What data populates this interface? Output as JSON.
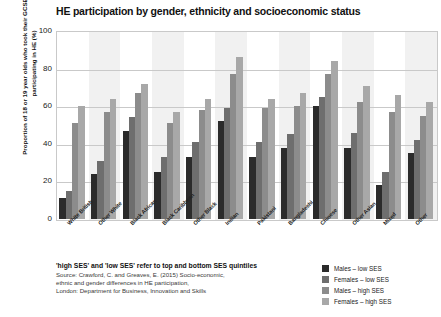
{
  "chart_data": {
    "type": "bar",
    "title": "HE participation by gender, ethnicity and socioeconomic status",
    "xlabel": "",
    "ylabel": "Proportion of 18 or 19 year olds who took their GCSEs in 2008 participating in HE (%)",
    "ylim": [
      0,
      100
    ],
    "yticks": [
      0,
      20,
      40,
      60,
      80,
      100
    ],
    "grid": true,
    "legend_position": "bottom-right",
    "categories": [
      "White British",
      "Other White",
      "Black African",
      "Black Caribbean",
      "Other Black",
      "Indian",
      "Pakistani",
      "Bangladeshi",
      "Chinese",
      "Other Asian",
      "Mixed",
      "Other"
    ],
    "series": [
      {
        "name": "Males – low SES",
        "color": "#2b2b2b",
        "values": [
          11,
          24,
          47,
          25,
          33,
          52,
          33,
          38,
          60,
          38,
          18,
          35
        ]
      },
      {
        "name": "Females – low SES",
        "color": "#6e6e6e",
        "values": [
          15,
          31,
          54,
          33,
          41,
          59,
          41,
          45,
          65,
          46,
          25,
          42
        ]
      },
      {
        "name": "Males – high SES",
        "color": "#8c8c8c",
        "values": [
          51,
          57,
          67,
          51,
          58,
          77,
          59,
          60,
          77,
          62,
          57,
          55
        ]
      },
      {
        "name": "Females – high SES",
        "color": "#a8a8a8",
        "values": [
          60,
          64,
          72,
          57,
          64,
          86,
          64,
          67,
          84,
          71,
          66,
          62
        ]
      }
    ]
  },
  "footnote": {
    "headline": "'high SES' and 'low SES' refer to top and bottom SES quintiles",
    "source_lines": [
      "Source: Crawford, C. and Greaves, E. (2015) Socio-economic,",
      "ethnic and gender differences in HE participation,",
      "London: Department for Business, Innovation and Skills"
    ]
  }
}
